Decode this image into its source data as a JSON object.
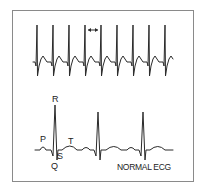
{
  "figure": {
    "title": "NORMAL ECG",
    "colors": {
      "stroke": "#2a2a2a",
      "frame": "#8a8a8a",
      "background": "#ffffff"
    }
  },
  "top_strip": {
    "description": "Continuous rhythm strip with regular spikes",
    "spike_count": 9,
    "interval_marker": "↔"
  },
  "bottom_strip": {
    "description": "Normal sinus rhythm with labeled waves",
    "beat_count": 3,
    "labels": {
      "p": "P",
      "q": "Q",
      "r": "R",
      "s": "S",
      "t": "T"
    },
    "caption": "NORMAL ECG"
  }
}
